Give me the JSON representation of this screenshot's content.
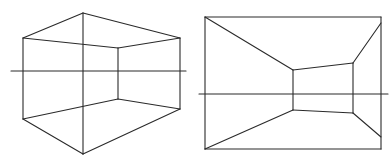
{
  "diagram": {
    "style": {
      "stroke": "#2a2a2a",
      "background": "#ffffff"
    },
    "figures": [
      {
        "name": "two-point-perspective-box",
        "horizon": {
          "y": 71,
          "x1": 11,
          "x2": 186
        },
        "segments": [
          [
            23,
            38,
            83,
            13
          ],
          [
            83,
            13,
            180,
            38
          ],
          [
            23,
            38,
            118,
            48
          ],
          [
            118,
            48,
            180,
            38
          ],
          [
            23,
            38,
            23,
            119
          ],
          [
            180,
            38,
            180,
            109
          ],
          [
            83,
            13,
            83,
            154
          ],
          [
            118,
            48,
            118,
            99
          ],
          [
            23,
            119,
            118,
            99
          ],
          [
            118,
            99,
            180,
            109
          ],
          [
            23,
            119,
            83,
            154
          ],
          [
            83,
            154,
            180,
            109
          ]
        ]
      },
      {
        "name": "one-point-perspective-room",
        "horizon": {
          "y": 94,
          "x1": 199,
          "x2": 388
        },
        "segments": [
          [
            205,
            17,
            381,
            17
          ],
          [
            381,
            17,
            381,
            149
          ],
          [
            381,
            149,
            205,
            149
          ],
          [
            205,
            149,
            205,
            17
          ],
          [
            205,
            17,
            293,
            70
          ],
          [
            381,
            23,
            353,
            63
          ],
          [
            205,
            149,
            293,
            110
          ],
          [
            381,
            137,
            353,
            113
          ],
          [
            293,
            70,
            353,
            63
          ],
          [
            353,
            63,
            353,
            113
          ],
          [
            353,
            113,
            293,
            110
          ],
          [
            293,
            110,
            293,
            70
          ]
        ]
      }
    ]
  }
}
